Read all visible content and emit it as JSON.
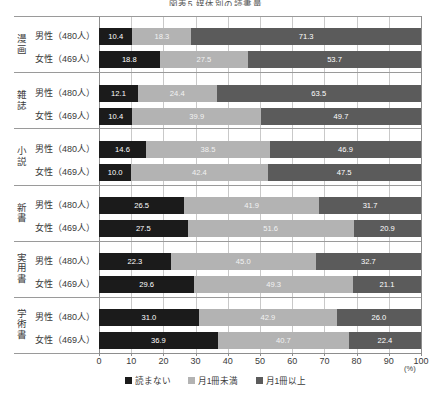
{
  "chart_data": {
    "type": "bar",
    "orientation": "horizontal",
    "stacked": true,
    "title": "図表5 媒体別の読書量",
    "xlabel": "",
    "ylabel": "",
    "unit": "(%)",
    "xlim": [
      0,
      100
    ],
    "xticks": [
      0,
      10,
      20,
      30,
      40,
      50,
      60,
      70,
      80,
      90,
      100
    ],
    "grid": true,
    "legend_position": "bottom",
    "series": [
      {
        "name": "読まない",
        "color": "#1b1b1b"
      },
      {
        "name": "月1冊未満",
        "color": "#b3b3b3"
      },
      {
        "name": "月1冊以上",
        "color": "#5b5b5b"
      }
    ],
    "groups": [
      {
        "category": "漫画",
        "rows": [
          {
            "label": "男性（480人）",
            "values": [
              10.4,
              18.3,
              71.3
            ]
          },
          {
            "label": "女性（469人）",
            "values": [
              18.8,
              27.5,
              53.7
            ]
          }
        ]
      },
      {
        "category": "雑誌",
        "rows": [
          {
            "label": "男性（480人）",
            "values": [
              12.1,
              24.4,
              63.5
            ]
          },
          {
            "label": "女性（469人）",
            "values": [
              10.4,
              39.9,
              49.7
            ]
          }
        ]
      },
      {
        "category": "小説",
        "rows": [
          {
            "label": "男性（480人）",
            "values": [
              14.6,
              38.5,
              46.9
            ]
          },
          {
            "label": "女性（469人）",
            "values": [
              10.0,
              42.4,
              47.5
            ]
          }
        ]
      },
      {
        "category": "新書",
        "rows": [
          {
            "label": "男性（480人）",
            "values": [
              26.5,
              41.9,
              31.7
            ]
          },
          {
            "label": "女性（469人）",
            "values": [
              27.5,
              51.6,
              20.9
            ]
          }
        ]
      },
      {
        "category": "実用書",
        "rows": [
          {
            "label": "男性（480人）",
            "values": [
              22.3,
              45.0,
              32.7
            ]
          },
          {
            "label": "女性（469人）",
            "values": [
              29.6,
              49.3,
              21.1
            ]
          }
        ]
      },
      {
        "category": "学術書",
        "rows": [
          {
            "label": "男性（480人）",
            "values": [
              31.0,
              42.9,
              26.0
            ]
          },
          {
            "label": "女性（469人）",
            "values": [
              36.9,
              40.7,
              22.4
            ]
          }
        ]
      }
    ]
  }
}
